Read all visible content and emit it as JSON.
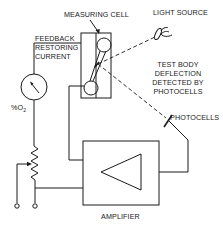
{
  "diagram": {
    "type": "schematic",
    "labels": {
      "measuring_cell": "MEASURING CELL",
      "light_source": "LIGHT SOURCE",
      "feedback_line1": "FEEDBACK",
      "feedback_line2": "RESTORING",
      "feedback_line3": "CURRENT",
      "meter": "%O",
      "meter_subscript": "2",
      "deflection_line1": "TEST BODY",
      "deflection_line2": "DEFLECTION",
      "deflection_line3": "DETECTED BY",
      "deflection_line4": "PHOTOCELLS",
      "photocells": "PHOTOCELLS",
      "amplifier": "AMPLIFIER"
    },
    "components": [
      {
        "id": "measuring-cell",
        "kind": "cell with two spheres on a dumbbell"
      },
      {
        "id": "light-source",
        "kind": "lamp with lens"
      },
      {
        "id": "photocells",
        "kind": "detector"
      },
      {
        "id": "amplifier",
        "kind": "amplifier triangle in box"
      },
      {
        "id": "meter",
        "kind": "%O2 analog meter"
      },
      {
        "id": "potentiometer",
        "kind": "variable resistor"
      },
      {
        "id": "output-terminals",
        "kind": "two terminals"
      }
    ],
    "colors": {
      "ink": "#1a1a1a",
      "background": "#ffffff"
    }
  }
}
